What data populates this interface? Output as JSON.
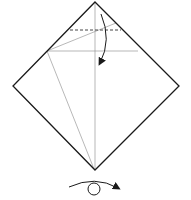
{
  "diagram": {
    "type": "origami-fold-step",
    "colors": {
      "background": "#ffffff",
      "outline": "#1a1a1a",
      "crease": "#9a9a9a",
      "arrow": "#1a1a1a"
    },
    "elements": {
      "square": "paper-diamond",
      "valley_fold": "dashed-line",
      "fold_arrow": "curved-arrow-down",
      "turn_over": "turn-over-symbol"
    }
  }
}
